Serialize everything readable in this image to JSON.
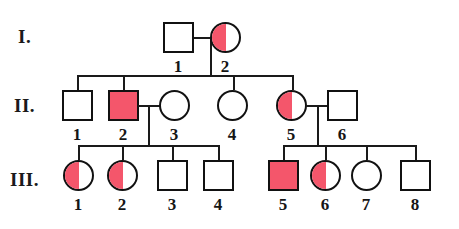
{
  "diagram": {
    "kind": "pedigree-chart",
    "background_color": "#ffffff",
    "line_color": "#1a1a1a",
    "symbol_outline_color": "#111111",
    "affected_fill_color": "#f4566b",
    "unaffected_fill_color": "#ffffff"
  },
  "generations": [
    {
      "label": "I."
    },
    {
      "label": "II."
    },
    {
      "label": "III."
    }
  ],
  "individuals": [
    {
      "id": "I-1",
      "number": "1",
      "sex": "male",
      "shape": "square",
      "fill": "none",
      "generation": "I"
    },
    {
      "id": "I-2",
      "number": "2",
      "sex": "female",
      "shape": "circle",
      "fill": "half-left",
      "generation": "I"
    },
    {
      "id": "II-1",
      "number": "1",
      "sex": "male",
      "shape": "square",
      "fill": "none",
      "generation": "II"
    },
    {
      "id": "II-2",
      "number": "2",
      "sex": "male",
      "shape": "square",
      "fill": "full",
      "generation": "II"
    },
    {
      "id": "II-3",
      "number": "3",
      "sex": "female",
      "shape": "circle",
      "fill": "none",
      "generation": "II"
    },
    {
      "id": "II-4",
      "number": "4",
      "sex": "female",
      "shape": "circle",
      "fill": "none",
      "generation": "II"
    },
    {
      "id": "II-5",
      "number": "5",
      "sex": "female",
      "shape": "circle",
      "fill": "half-left",
      "generation": "II"
    },
    {
      "id": "II-6",
      "number": "6",
      "sex": "male",
      "shape": "square",
      "fill": "none",
      "generation": "II"
    },
    {
      "id": "III-1",
      "number": "1",
      "sex": "female",
      "shape": "circle",
      "fill": "half-left",
      "generation": "III"
    },
    {
      "id": "III-2",
      "number": "2",
      "sex": "female",
      "shape": "circle",
      "fill": "half-left",
      "generation": "III"
    },
    {
      "id": "III-3",
      "number": "3",
      "sex": "male",
      "shape": "square",
      "fill": "none",
      "generation": "III"
    },
    {
      "id": "III-4",
      "number": "4",
      "sex": "male",
      "shape": "square",
      "fill": "none",
      "generation": "III"
    },
    {
      "id": "III-5",
      "number": "5",
      "sex": "male",
      "shape": "square",
      "fill": "full",
      "generation": "III"
    },
    {
      "id": "III-6",
      "number": "6",
      "sex": "female",
      "shape": "circle",
      "fill": "half-left",
      "generation": "III"
    },
    {
      "id": "III-7",
      "number": "7",
      "sex": "female",
      "shape": "circle",
      "fill": "none",
      "generation": "III"
    },
    {
      "id": "III-8",
      "number": "8",
      "sex": "male",
      "shape": "square",
      "fill": "none",
      "generation": "III"
    }
  ],
  "matings": [
    {
      "partners": [
        "I-1",
        "I-2"
      ],
      "children": [
        "II-1",
        "II-2",
        "II-4",
        "II-5"
      ]
    },
    {
      "partners": [
        "II-2",
        "II-3"
      ],
      "children": [
        "III-1",
        "III-2",
        "III-3",
        "III-4"
      ]
    },
    {
      "partners": [
        "II-5",
        "II-6"
      ],
      "children": [
        "III-5",
        "III-6",
        "III-7",
        "III-8"
      ]
    }
  ]
}
